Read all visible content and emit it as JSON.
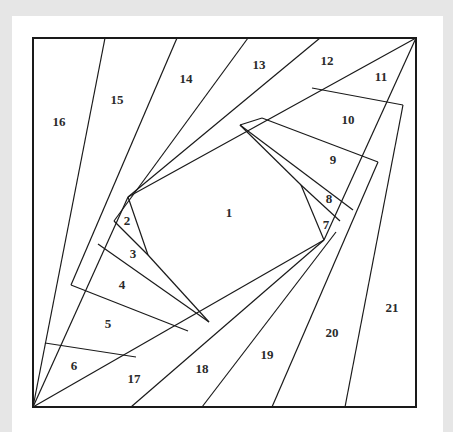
{
  "diagram": {
    "colors": {
      "background": "#e6e6e6",
      "panel": "#ffffff",
      "line": "#1a1a1a",
      "label": "#2a2a2a"
    },
    "frame": {
      "x": 33,
      "y": 38,
      "width": 383,
      "height": 369
    },
    "lines": [
      [
        105,
        38,
        33,
        407
      ],
      [
        177,
        38,
        71,
        285
      ],
      [
        248,
        38,
        114,
        221
      ],
      [
        320,
        38,
        128,
        197
      ],
      [
        416,
        38,
        128,
        197
      ],
      [
        128,
        197,
        33,
        407
      ],
      [
        128,
        197,
        148,
        255
      ],
      [
        114,
        221,
        148,
        255
      ],
      [
        98,
        244,
        209,
        322
      ],
      [
        71,
        285,
        188,
        331
      ],
      [
        45,
        343,
        136,
        357
      ],
      [
        148,
        255,
        209,
        322
      ],
      [
        33,
        407,
        324,
        240
      ],
      [
        131,
        407,
        324,
        240
      ],
      [
        202,
        407,
        336,
        232
      ],
      [
        272,
        407,
        378,
        162
      ],
      [
        345,
        407,
        403,
        105
      ],
      [
        416,
        38,
        324,
        240
      ],
      [
        240,
        125,
        301,
        185
      ],
      [
        301,
        185,
        324,
        240
      ],
      [
        240,
        125,
        353,
        210
      ],
      [
        262,
        118,
        378,
        162
      ],
      [
        312,
        88,
        403,
        105
      ],
      [
        301,
        185,
        340,
        221
      ],
      [
        240,
        125,
        262,
        118
      ]
    ],
    "pieces": [
      {
        "id": "1",
        "x": 229,
        "y": 214
      },
      {
        "id": "2",
        "x": 127,
        "y": 222
      },
      {
        "id": "3",
        "x": 133,
        "y": 255
      },
      {
        "id": "4",
        "x": 122,
        "y": 286
      },
      {
        "id": "5",
        "x": 108,
        "y": 325
      },
      {
        "id": "6",
        "x": 74,
        "y": 367
      },
      {
        "id": "7",
        "x": 326,
        "y": 226
      },
      {
        "id": "8",
        "x": 329,
        "y": 200
      },
      {
        "id": "9",
        "x": 333,
        "y": 161
      },
      {
        "id": "10",
        "x": 348,
        "y": 121
      },
      {
        "id": "11",
        "x": 381,
        "y": 78
      },
      {
        "id": "12",
        "x": 327,
        "y": 62
      },
      {
        "id": "13",
        "x": 259,
        "y": 66
      },
      {
        "id": "14",
        "x": 186,
        "y": 80
      },
      {
        "id": "15",
        "x": 117,
        "y": 101
      },
      {
        "id": "16",
        "x": 59,
        "y": 123
      },
      {
        "id": "17",
        "x": 134,
        "y": 380
      },
      {
        "id": "18",
        "x": 202,
        "y": 370
      },
      {
        "id": "19",
        "x": 267,
        "y": 356
      },
      {
        "id": "20",
        "x": 332,
        "y": 334
      },
      {
        "id": "21",
        "x": 392,
        "y": 309
      }
    ]
  }
}
